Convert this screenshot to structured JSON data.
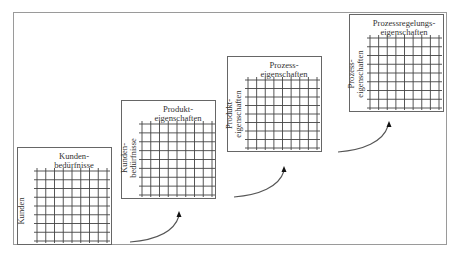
{
  "diagram": {
    "type": "house-of-quality-cascade",
    "stages": [
      {
        "id": "stage-1",
        "top_label": "Kunden-\nbedürfnisse",
        "side_label": "Kunden",
        "columns": 8,
        "rows": 8
      },
      {
        "id": "stage-2",
        "top_label": "Produkt-\neigenschaften",
        "side_label": "Kunden-\nbedürfnisse",
        "columns": 8,
        "rows": 8
      },
      {
        "id": "stage-3",
        "top_label": "Prozess-\neigenschaften",
        "side_label": "Produkt-\neigenschaften",
        "columns": 8,
        "rows": 8
      },
      {
        "id": "stage-4",
        "top_label": "Prozessregelungs-\neigenschaften",
        "side_label": "Prozess-\neigenschaften",
        "columns": 8,
        "rows": 8
      }
    ],
    "connectors": [
      {
        "from": "stage-1",
        "to": "stage-2"
      },
      {
        "from": "stage-2",
        "to": "stage-3"
      },
      {
        "from": "stage-3",
        "to": "stage-4"
      }
    ],
    "colors": {
      "frame": "#9a9a9a",
      "box": "#666666",
      "grid": "#444444",
      "arrow": "#555555",
      "arrowhead": "#111111"
    }
  }
}
